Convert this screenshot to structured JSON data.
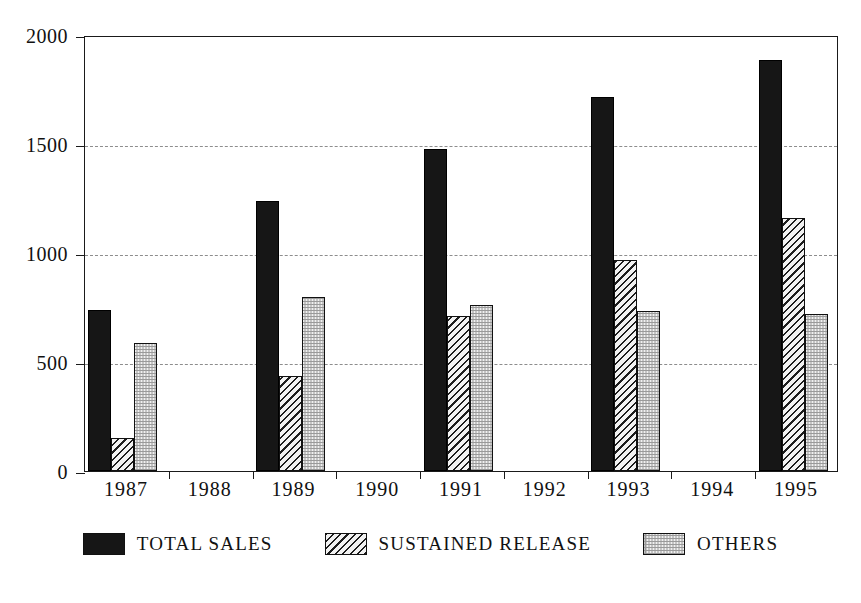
{
  "chart_data": {
    "type": "bar",
    "title": "",
    "subtitle": "",
    "xlabel": "",
    "ylabel": "",
    "categories": [
      "1987",
      "1988",
      "1989",
      "1990",
      "1991",
      "1992",
      "1993",
      "1994",
      "1995"
    ],
    "series": [
      {
        "name": "TOTAL SALES",
        "pattern": "solid-black",
        "color": "#161616",
        "values": [
          740,
          null,
          1240,
          null,
          1475,
          null,
          1715,
          null,
          1885
        ]
      },
      {
        "name": "SUSTAINED RELEASE",
        "pattern": "diagonal-hatch",
        "color": "#1d1d1d",
        "values": [
          150,
          null,
          435,
          null,
          710,
          null,
          970,
          null,
          1160
        ]
      },
      {
        "name": "OTHERS",
        "pattern": "light-stipple",
        "color": "#d9d9d9",
        "values": [
          585,
          null,
          800,
          null,
          760,
          null,
          735,
          null,
          720
        ]
      }
    ],
    "ylim": [
      0,
      2000
    ],
    "yticks": [
      0,
      500,
      1000,
      1500,
      2000
    ],
    "ytick_labels": [
      "0",
      "500",
      "1000",
      "1500",
      "2000"
    ],
    "gridlines": [
      500,
      1000,
      1500
    ],
    "grid": true,
    "grid_style": "dash-dot",
    "legend_position": "bottom-center",
    "frame": true,
    "background": "#ffffff"
  },
  "axis": {
    "y_labels": [
      "2000",
      "1500",
      "1000",
      "500",
      "0"
    ],
    "x_labels": [
      "1987",
      "1988",
      "1989",
      "1990",
      "1991",
      "1992",
      "1993",
      "1994",
      "1995"
    ]
  },
  "legend": {
    "items": [
      {
        "label": "TOTAL SALES",
        "swatch": "solid-black-swatch"
      },
      {
        "label": "SUSTAINED RELEASE",
        "swatch": "diagonal-hatch-swatch"
      },
      {
        "label": "OTHERS",
        "swatch": "light-stipple-swatch"
      }
    ]
  }
}
